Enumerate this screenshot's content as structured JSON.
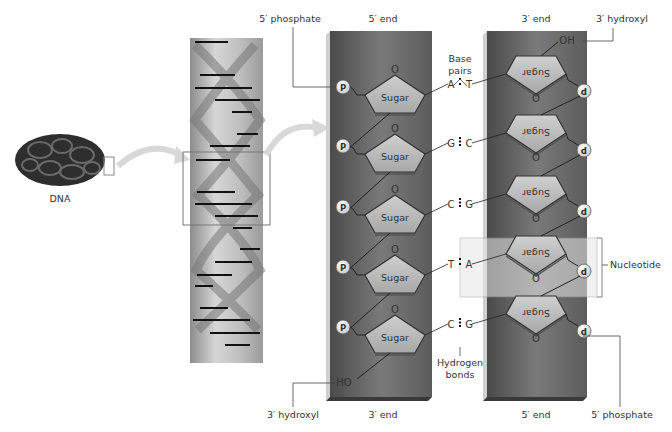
{
  "labels": {
    "dna": "DNA",
    "top_left_phosphate": "5′ phosphate",
    "left_top_end": "5′ end",
    "right_top_end": "3′ end",
    "top_right_hydroxyl": "3′ hydroxyl",
    "base_pairs_line1": "Base",
    "base_pairs_line2": "pairs",
    "nucleotide": "Nucleotide",
    "hydrogen_line1": "Hydrogen",
    "hydrogen_line2": "bonds",
    "bottom_left_hydroxyl": "3′ hydroxyl",
    "left_bottom_end": "3′ end",
    "right_bottom_end": "5′ end",
    "bottom_right_phosphate": "5′ phosphate",
    "oh_top": "OH",
    "ho_bottom": "HO"
  },
  "sugar_label": "Sugar",
  "phosphate_label": "P",
  "oxygen_label": "O",
  "base_pairs": [
    {
      "left": "A",
      "right": "T"
    },
    {
      "left": "G",
      "right": "C"
    },
    {
      "left": "C",
      "right": "G"
    },
    {
      "left": "T",
      "right": "A"
    },
    {
      "left": "C",
      "right": "G"
    }
  ],
  "colors": {
    "strand_dark": "#5a5a5a",
    "strand_light": "#8a8a8a",
    "sugar_fill": "#b8b8b8",
    "phosphate_fill": "#e8e8e8",
    "nucleotide_highlight": "#dcdcdc",
    "arrow": "#d8d8d8"
  }
}
